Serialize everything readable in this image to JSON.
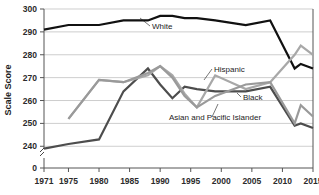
{
  "chart_data": {
    "type": "line",
    "title": "",
    "xlabel": "",
    "ylabel": "Scale Score",
    "ylim": [
      235,
      300
    ],
    "xlim": [
      1971,
      2015
    ],
    "grid": true,
    "legend": "inline-labels",
    "y_ticks": [
      "300",
      "290",
      "280",
      "270",
      "260",
      "250",
      "240",
      "0"
    ],
    "y_tick_values": [
      300,
      290,
      280,
      270,
      260,
      250,
      240,
      0
    ],
    "x_ticks": [
      "1971",
      "1975",
      "1980",
      "1985",
      "1990",
      "1995",
      "2000",
      "2005",
      "2010",
      "2015"
    ],
    "x_tick_values": [
      1971,
      1975,
      1980,
      1985,
      1990,
      1995,
      2000,
      2005,
      2010,
      2015
    ],
    "axis_break": true,
    "series": [
      {
        "name": "White",
        "color": "#111111",
        "width": 2.2,
        "label_x": 1988,
        "label_y": 294,
        "x": [
          1971,
          1975,
          1980,
          1984,
          1988,
          1990,
          1992,
          1994,
          1996,
          1999,
          2004,
          2008,
          2012,
          2013,
          2015
        ],
        "values": [
          291,
          293,
          293,
          295,
          295,
          297,
          297,
          296,
          296,
          295,
          293,
          295,
          274,
          276,
          274
        ]
      },
      {
        "name": "Black",
        "color": "#4d4d4d",
        "width": 2.2,
        "label_x": 2006,
        "label_y": 262,
        "x": [
          1971,
          1975,
          1980,
          1984,
          1988,
          1990,
          1992,
          1994,
          1996,
          1999,
          2004,
          2008,
          2012,
          2013,
          2015
        ],
        "values": [
          239,
          241,
          243,
          264,
          274,
          267,
          261,
          266,
          265,
          264,
          264,
          266,
          249,
          250,
          248
        ]
      },
      {
        "name": "Hispanic",
        "color": "#a8a8a8",
        "width": 2.2,
        "label_x": 2001,
        "label_y": 273,
        "x": [
          1975,
          1980,
          1984,
          1988,
          1990,
          1992,
          1994,
          1996,
          1999,
          2004,
          2008,
          2012,
          2013,
          2015
        ],
        "values": [
          252,
          269,
          268,
          271,
          275,
          271,
          263,
          257,
          271,
          265,
          268,
          280,
          284,
          280
        ]
      },
      {
        "name": "Asian and Pacific Islander",
        "color": "#9a9a9a",
        "width": 2.2,
        "label_x": 1997,
        "label_y": 255,
        "x": [
          1975,
          1980,
          1984,
          1988,
          1990,
          1992,
          1994,
          1996,
          1999,
          2004,
          2008,
          2012,
          2013,
          2015
        ],
        "values": [
          252,
          269,
          268,
          272,
          275,
          270,
          262,
          257,
          262,
          267,
          268,
          250,
          258,
          253
        ]
      }
    ],
    "annotations": [
      {
        "text": "White",
        "x": 1988,
        "y": 294
      },
      {
        "text": "Hispanic",
        "x": 2001,
        "y": 273
      },
      {
        "text": "Black",
        "x": 2006,
        "y": 262
      },
      {
        "text": "Asian and Pacific Islander",
        "x": 1997,
        "y": 255
      }
    ]
  }
}
